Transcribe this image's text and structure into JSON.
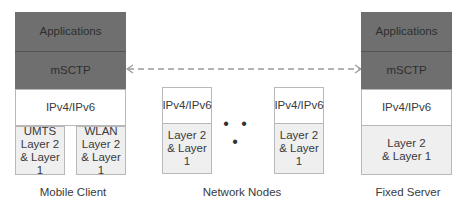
{
  "diagram": {
    "mobile_client": {
      "label": "Mobile Client",
      "layers": {
        "applications": "Applications",
        "transport": "mSCTP",
        "network": "IPv4/IPv6"
      },
      "link_layers": [
        {
          "line1": "UMTS",
          "line2": "Layer 2",
          "line3": "& Layer 1"
        },
        {
          "line1": "WLAN",
          "line2": "Layer 2",
          "line3": "& Layer 1"
        }
      ]
    },
    "network_nodes": {
      "label": "Network Nodes",
      "ellipsis": "• • •",
      "nodes": [
        {
          "network": "IPv4/IPv6",
          "link_line1": "Layer 2",
          "link_line2": "& Layer 1"
        },
        {
          "network": "IPv4/IPv6",
          "link_line1": "Layer 2",
          "link_line2": "& Layer 1"
        }
      ]
    },
    "fixed_server": {
      "label": "Fixed Server",
      "layers": {
        "applications": "Applications",
        "transport": "mSCTP",
        "network": "IPv4/IPv6",
        "link_line1": "Layer 2",
        "link_line2": "& Layer 1"
      }
    },
    "connection": {
      "style": "dashed",
      "direction": "bidirectional",
      "between": [
        "mSCTP",
        "mSCTP"
      ]
    },
    "colors": {
      "dark_layer": "#6f6f6f",
      "light_layer": "#efefef",
      "border": "#b8b8b8",
      "arrow": "#9a9a9a"
    }
  }
}
